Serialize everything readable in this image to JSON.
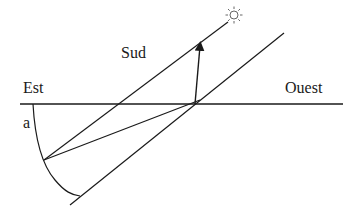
{
  "labels": {
    "south": "Sud",
    "east": "Est",
    "west": "Ouest",
    "angle": "a"
  },
  "icons": {
    "sun": "sun-icon"
  },
  "colors": {
    "stroke": "#1a1a1a",
    "sun": "#555555",
    "background": "#ffffff"
  }
}
